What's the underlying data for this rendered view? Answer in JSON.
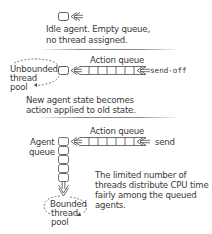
{
  "panels": {
    "idle": {
      "caption_line1": "Idle agent.  Empty queue,",
      "caption_line2": "no thread assigned."
    },
    "send_off": {
      "queue_label": "Action queue",
      "dispatch_label": "send-off",
      "pool_line1": "Unbounded",
      "pool_line2": "thread",
      "pool_line3": "pool",
      "caption_line1": "New agent state becomes",
      "caption_line2": "action applied to old state."
    },
    "send": {
      "queue_label": "Action queue",
      "dispatch_label": "send",
      "agent_queue_line1": "Agent",
      "agent_queue_line2": "queue",
      "pool_line1": "Bounded",
      "pool_line2": "thread",
      "pool_line3": "pool",
      "caption_line1": "The limited number of",
      "caption_line2": "threads distribute CPU time",
      "caption_line3": "fairly among the queued",
      "caption_line4": "agents."
    }
  },
  "colors": {
    "stroke": "#4a4a4a",
    "text": "#3a3a3a",
    "separator": "#8a8a8a"
  }
}
